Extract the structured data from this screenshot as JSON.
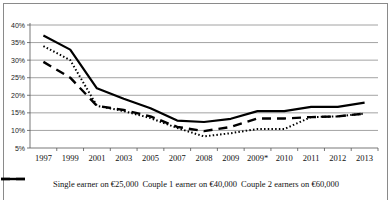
{
  "chart_data": {
    "type": "line",
    "title": "",
    "xlabel": "",
    "ylabel": "",
    "categories": [
      "1997",
      "1999",
      "2001",
      "2003",
      "2005",
      "2007",
      "2008",
      "2009",
      "2009*",
      "2010",
      "2011",
      "2012",
      "2013"
    ],
    "y_ticks": [
      "5%",
      "10%",
      "15%",
      "20%",
      "25%",
      "30%",
      "35%",
      "40%"
    ],
    "ylim": [
      5,
      40
    ],
    "grid": true,
    "legend_position": "bottom",
    "series": [
      {
        "name": "Single earner on €25,000",
        "style": "dotted",
        "values": [
          34,
          30,
          17,
          15.5,
          13.5,
          10.7,
          8.3,
          9.2,
          10.4,
          10.4,
          13.8,
          14,
          14.8
        ]
      },
      {
        "name": "Couple 1 earner on €40,000",
        "style": "dashed",
        "values": [
          29.5,
          25,
          17,
          15.8,
          14,
          11,
          9.8,
          11,
          13.4,
          13.4,
          13.8,
          14,
          14.8
        ]
      },
      {
        "name": "Couple 2 earners on €60,000",
        "style": "solid",
        "values": [
          37,
          33,
          22,
          19,
          16.3,
          12.8,
          12.4,
          13.3,
          15.5,
          15.5,
          16.7,
          16.7,
          17.9
        ]
      }
    ]
  },
  "legend": {
    "items": [
      {
        "label": "Single earner on €25,000",
        "style": "dotted"
      },
      {
        "label": "Couple 1 earner on €40,000",
        "style": "dashed"
      },
      {
        "label": "Couple 2 earners on €60,000",
        "style": "solid"
      }
    ]
  },
  "colors": {
    "line": "#000000",
    "grid": "#8c8c8c",
    "axis": "#555555",
    "frame": "#8a8a8a"
  }
}
